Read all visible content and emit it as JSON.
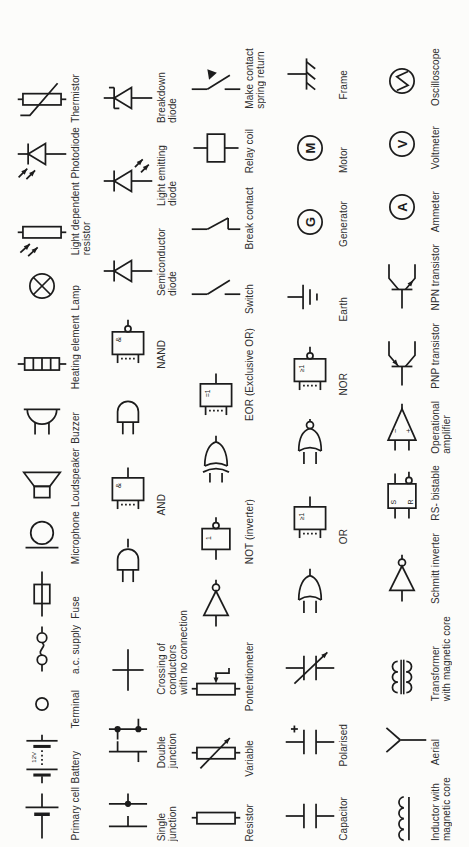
{
  "page": {
    "background": "#fcfcfa",
    "ink": "#1c1c1c",
    "title": "Electronic circuit symbols chart (rotated page)"
  },
  "symbol_text": {
    "and_gate": "&",
    "or_gate": "≥1",
    "not_gate": "1",
    "eor_gate": "=1",
    "generator": "G",
    "motor": "M",
    "ammeter": "A",
    "voltmeter": "V",
    "bistable_set": "S",
    "bistable_reset": "R",
    "opamp_minus": "−",
    "opamp_plus": "+",
    "battery_voltage": "12V",
    "polarised_plus": "+"
  },
  "columns": [
    {
      "name": "column-1",
      "items": [
        {
          "id": "thermistor",
          "label": "Thermistor",
          "symbol": "thermistor"
        },
        {
          "id": "photodiode",
          "label": "Photodiode",
          "symbol": "photodiode"
        },
        {
          "id": "light-dependent-resistor",
          "label": "Light dependent\nresistor",
          "symbol": "ldr"
        },
        {
          "id": "lamp",
          "label": "Lamp",
          "symbol": "lamp"
        },
        {
          "id": "heating-element",
          "label": "Heating element",
          "symbol": "heating"
        },
        {
          "id": "buzzer",
          "label": "Buzzer",
          "symbol": "buzzer"
        },
        {
          "id": "loudspeaker",
          "label": "Loudspeaker",
          "symbol": "loudspeaker"
        },
        {
          "id": "microphone",
          "label": "Microphone",
          "symbol": "microphone"
        },
        {
          "id": "fuse",
          "label": "Fuse",
          "symbol": "fuse"
        },
        {
          "id": "ac-supply",
          "label": "a.c. supply",
          "symbol": "acsupply"
        },
        {
          "id": "terminal",
          "label": "Terminal",
          "symbol": "terminal"
        },
        {
          "id": "battery",
          "label": "Battery",
          "symbol": "battery"
        },
        {
          "id": "primary-cell",
          "label": "Primary cell",
          "symbol": "cell"
        }
      ]
    },
    {
      "name": "column-2",
      "items": [
        {
          "id": "breakdown-diode",
          "label": "Breakdown\ndiode",
          "symbol": "breakdown"
        },
        {
          "id": "light-emitting-diode",
          "label": "Light emitting\ndiode",
          "symbol": "led"
        },
        {
          "id": "semiconductor-diode",
          "label": "Semiconductor\ndiode",
          "symbol": "semidiode"
        },
        {
          "id": "nand-gate-iec",
          "label": "NAND",
          "symbol": "nandrect"
        },
        {
          "id": "nand-gate-shape",
          "label": "",
          "symbol": "nandshape"
        },
        {
          "id": "and-gate-iec",
          "label": "AND",
          "symbol": "andrect"
        },
        {
          "id": "and-gate-shape",
          "label": "",
          "symbol": "andshape"
        },
        {
          "id": "crossing-no-connection",
          "label": "Crossing of\nconductors\nwith no connection",
          "symbol": "crossing"
        },
        {
          "id": "double-junction",
          "label": "Double\njunction",
          "symbol": "doublejunction"
        },
        {
          "id": "single-junction",
          "label": "Single\njunction",
          "symbol": "singlejunction"
        }
      ]
    },
    {
      "name": "column-3",
      "items": [
        {
          "id": "make-contact-spring-return",
          "label": "Make contact\nspring return",
          "symbol": "makecontact"
        },
        {
          "id": "relay-coil",
          "label": "Relay coil",
          "symbol": "relaycoil"
        },
        {
          "id": "break-contact",
          "label": "Break contact",
          "symbol": "breakcontact"
        },
        {
          "id": "switch",
          "label": "Switch",
          "symbol": "switch"
        },
        {
          "id": "eor-gate-iec",
          "label": "EOR (Exclusive OR)",
          "symbol": "eorrect"
        },
        {
          "id": "eor-gate-shape",
          "label": "",
          "symbol": "eorshape"
        },
        {
          "id": "not-gate-iec",
          "label": "NOT (inverter)",
          "symbol": "notrect"
        },
        {
          "id": "not-gate-shape",
          "label": "",
          "symbol": "notshape"
        },
        {
          "id": "potentiometer",
          "label": "Pontentiometer",
          "symbol": "potentiometer"
        },
        {
          "id": "variable-resistor",
          "label": "Variable",
          "symbol": "variable"
        },
        {
          "id": "resistor",
          "label": "Resistor",
          "symbol": "resistor"
        }
      ]
    },
    {
      "name": "column-4",
      "items": [
        {
          "id": "frame",
          "label": "Frame",
          "symbol": "frame"
        },
        {
          "id": "motor",
          "label": "Motor",
          "symbol": "motor"
        },
        {
          "id": "generator",
          "label": "Generator",
          "symbol": "generator"
        },
        {
          "id": "earth",
          "label": "Earth",
          "symbol": "earth"
        },
        {
          "id": "nor-gate-iec",
          "label": "NOR",
          "symbol": "norrect"
        },
        {
          "id": "nor-gate-shape",
          "label": "",
          "symbol": "norshape"
        },
        {
          "id": "or-gate-iec",
          "label": "OR",
          "symbol": "orrect"
        },
        {
          "id": "or-gate-shape",
          "label": "",
          "symbol": "orshape"
        },
        {
          "id": "variable-capacitor",
          "label": "",
          "symbol": "varcap"
        },
        {
          "id": "polarised-capacitor",
          "label": "Polarised",
          "symbol": "polarised"
        },
        {
          "id": "capacitor",
          "label": "Capacitor",
          "symbol": "capacitor"
        }
      ]
    },
    {
      "name": "column-5",
      "items": [
        {
          "id": "oscilloscope",
          "label": "Oscilloscope",
          "symbol": "oscilloscope"
        },
        {
          "id": "voltmeter",
          "label": "Voltmeter",
          "symbol": "voltmeter"
        },
        {
          "id": "ammeter",
          "label": "Ammeter",
          "symbol": "ammeter"
        },
        {
          "id": "npn-transistor",
          "label": "NPN transistor",
          "symbol": "npn"
        },
        {
          "id": "pnp-transistor",
          "label": "PNP transistor",
          "symbol": "pnp"
        },
        {
          "id": "operational-amplifier",
          "label": "Operational\namplifier",
          "symbol": "opamp"
        },
        {
          "id": "rs-bistable",
          "label": "RS- bistable",
          "symbol": "rsbistable"
        },
        {
          "id": "schmitt-inverter",
          "label": "Schmitt inverter",
          "symbol": "notshape"
        },
        {
          "id": "transformer-magnetic-core",
          "label": "Transformer\nwith magnetic core",
          "symbol": "transformer"
        },
        {
          "id": "aerial",
          "label": "Aerial",
          "symbol": "aerial"
        },
        {
          "id": "inductor-magnetic-core",
          "label": "Inductor with\nmagnetic core",
          "symbol": "inductor"
        }
      ]
    }
  ]
}
